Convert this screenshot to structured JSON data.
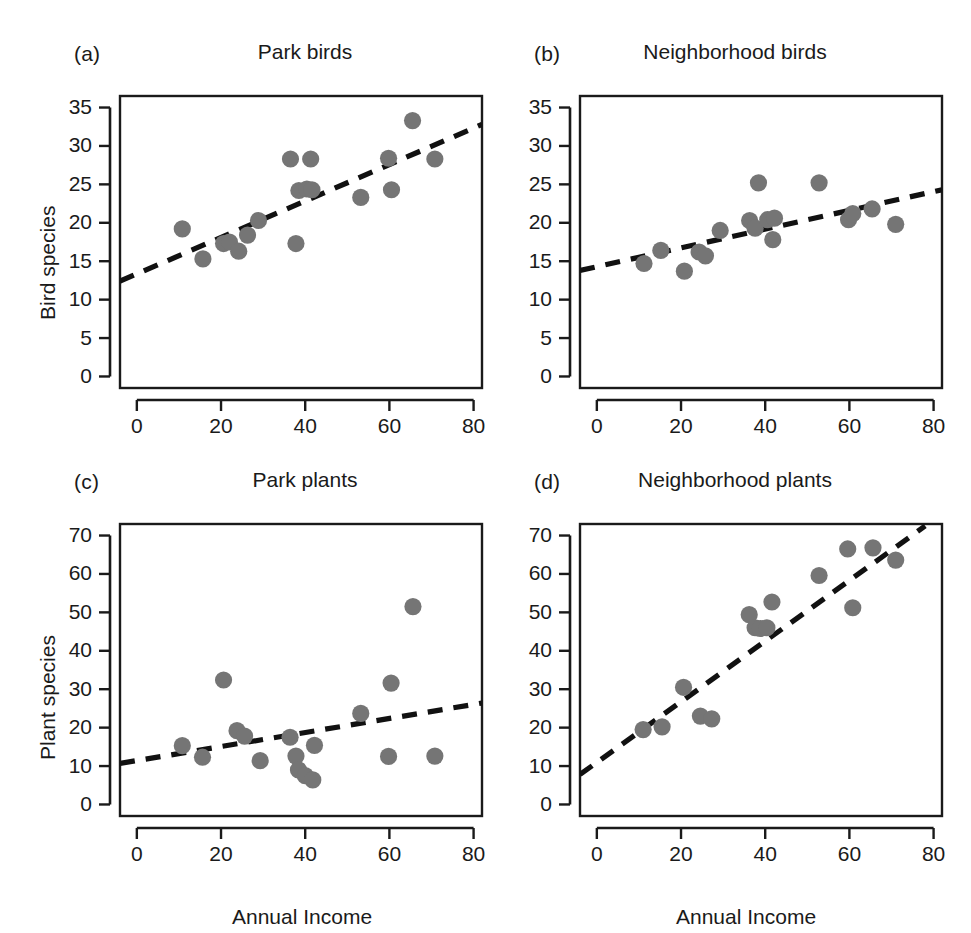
{
  "figure": {
    "width": 971,
    "height": 933,
    "background": "#ffffff",
    "point_color": "#757575",
    "line_color": "#111111",
    "axis_color": "#1a1a1a"
  },
  "axis_titles": {
    "y_top": "Bird species",
    "y_bottom": "Plant species",
    "x": "Annual Income"
  },
  "chart_data": [
    {
      "type": "scatter",
      "panel": "a",
      "tag": "(a)",
      "title": "Park birds",
      "xlabel": "Annual Income",
      "ylabel": "Bird species",
      "xlim": [
        -4,
        82
      ],
      "ylim": [
        -1.5,
        36.5
      ],
      "xticks": [
        0,
        20,
        40,
        60,
        80
      ],
      "yticks": [
        0,
        5,
        10,
        15,
        20,
        25,
        30,
        35
      ],
      "grid": false,
      "legend": "none",
      "x": [
        10.8,
        15.7,
        20.6,
        22.0,
        24.2,
        26.3,
        28.9,
        36.5,
        37.8,
        38.5,
        40.4,
        41.3,
        41.6,
        53.2,
        59.8,
        60.5,
        65.5,
        70.8
      ],
      "y": [
        19.2,
        15.3,
        17.3,
        17.5,
        16.3,
        18.4,
        20.3,
        28.3,
        17.3,
        24.2,
        24.4,
        28.3,
        24.3,
        23.3,
        28.4,
        24.3,
        33.3,
        28.3
      ],
      "fit": {
        "type": "linear",
        "x0": -4,
        "y0": 12.4,
        "x1": 82,
        "y1": 32.8,
        "style": "dashed"
      }
    },
    {
      "type": "scatter",
      "panel": "b",
      "tag": "(b)",
      "title": "Neighborhood birds",
      "xlabel": "Annual Income",
      "ylabel": "Bird species",
      "xlim": [
        -4,
        82
      ],
      "ylim": [
        -1.5,
        36.5
      ],
      "xticks": [
        0,
        20,
        40,
        60,
        80
      ],
      "yticks": [
        0,
        5,
        10,
        15,
        20,
        25,
        30,
        35
      ],
      "grid": false,
      "legend": "none",
      "x": [
        11.2,
        15.2,
        20.8,
        24.3,
        25.8,
        29.3,
        36.3,
        37.6,
        38.4,
        40.6,
        41.8,
        42.2,
        52.8,
        59.8,
        60.8,
        65.4,
        71.0
      ],
      "y": [
        14.7,
        16.4,
        13.7,
        16.2,
        15.7,
        19.0,
        20.3,
        19.3,
        25.2,
        20.4,
        17.8,
        20.6,
        25.2,
        20.4,
        21.2,
        21.8,
        19.8
      ],
      "fit": {
        "type": "linear",
        "x0": -4,
        "y0": 13.8,
        "x1": 82,
        "y1": 24.3,
        "style": "dashed"
      }
    },
    {
      "type": "scatter",
      "panel": "c",
      "tag": "(c)",
      "title": "Park plants",
      "xlabel": "Annual Income",
      "ylabel": "Plant species",
      "xlim": [
        -4,
        82
      ],
      "ylim": [
        -3,
        73
      ],
      "xticks": [
        0,
        20,
        40,
        60,
        80
      ],
      "yticks": [
        0,
        10,
        20,
        30,
        40,
        50,
        60,
        70
      ],
      "grid": false,
      "legend": "none",
      "x": [
        10.8,
        15.6,
        20.6,
        23.8,
        25.6,
        29.3,
        36.4,
        37.8,
        38.4,
        40.0,
        41.8,
        42.2,
        53.2,
        59.8,
        60.4,
        65.6,
        70.8
      ],
      "y": [
        15.3,
        12.3,
        32.4,
        19.2,
        17.8,
        11.4,
        17.5,
        12.6,
        9.0,
        7.5,
        6.4,
        15.4,
        23.7,
        12.5,
        31.6,
        51.5,
        12.6
      ],
      "fit": {
        "type": "linear",
        "x0": -4,
        "y0": 10.7,
        "x1": 82,
        "y1": 26.4,
        "style": "dashed"
      }
    },
    {
      "type": "scatter",
      "panel": "d",
      "tag": "(d)",
      "title": "Neighborhood plants",
      "xlabel": "Annual Income",
      "ylabel": "Plant species",
      "xlim": [
        -4,
        82
      ],
      "ylim": [
        -3,
        73
      ],
      "xticks": [
        0,
        20,
        40,
        60,
        80
      ],
      "yticks": [
        0,
        10,
        20,
        30,
        40,
        50,
        60,
        70
      ],
      "grid": false,
      "legend": "none",
      "x": [
        11.0,
        15.5,
        20.6,
        24.6,
        27.3,
        36.2,
        37.6,
        38.8,
        40.4,
        41.6,
        52.8,
        59.6,
        60.8,
        65.6,
        71.0
      ],
      "y": [
        19.5,
        20.2,
        30.5,
        23.0,
        22.3,
        49.4,
        46.0,
        45.8,
        46.0,
        52.7,
        59.6,
        66.5,
        51.2,
        66.8,
        63.6
      ],
      "fit": {
        "type": "linear",
        "x0": -4,
        "y0": 7.8,
        "x1": 78,
        "y1": 72.5,
        "style": "dashed"
      }
    }
  ]
}
